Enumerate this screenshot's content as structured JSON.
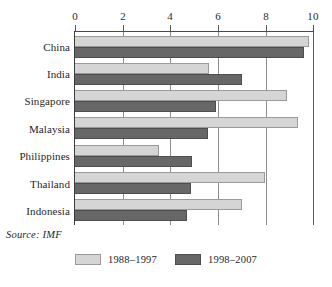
{
  "chart_data": {
    "type": "bar",
    "orientation": "horizontal",
    "title": "",
    "xlabel": "",
    "ylabel": "",
    "xlim": [
      0,
      10
    ],
    "xticks": [
      0,
      2,
      4,
      6,
      8,
      10
    ],
    "xtick_labels": [
      "0",
      "2",
      "4",
      "6",
      "8",
      "10"
    ],
    "grid": true,
    "grid_axis": "x",
    "categories": [
      "China",
      "India",
      "Singapore",
      "Malaysia",
      "Philippines",
      "Thailand",
      "Indonesia"
    ],
    "series": [
      {
        "name": "1988–1997",
        "color": "#d5d5d5",
        "values": [
          9.8,
          5.6,
          8.85,
          9.35,
          3.5,
          7.95,
          7.0
        ]
      },
      {
        "name": "1998–2007",
        "color": "#676767",
        "values": [
          9.6,
          7.0,
          5.9,
          5.55,
          4.9,
          4.85,
          4.7
        ]
      }
    ],
    "legend": {
      "position": "bottom",
      "entries": [
        "1988–1997",
        "1998–2007"
      ]
    },
    "annotations": {
      "source": "Source: IMF"
    }
  },
  "axis": {
    "labels": [
      "0",
      "2",
      "4",
      "6",
      "8",
      "10"
    ]
  },
  "source": {
    "text": "Source: IMF"
  },
  "legend": {
    "items": [
      {
        "label": "1988–1997"
      },
      {
        "label": "1998–2007"
      }
    ]
  }
}
